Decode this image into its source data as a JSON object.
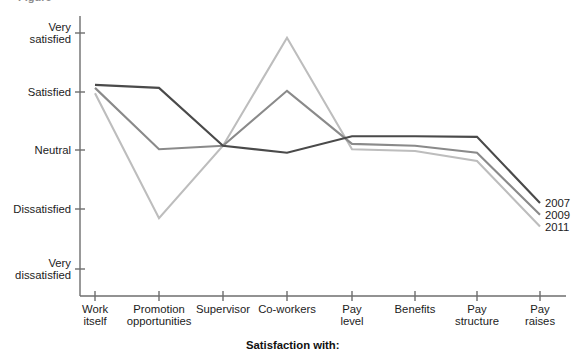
{
  "top_cropped_text": "Figure",
  "axis_title_x": "Satisfaction with:",
  "y_axis": {
    "labels": [
      {
        "line1": "Very",
        "line2": "satisfied",
        "value": 5
      },
      {
        "line1": "Satisfied",
        "line2": "",
        "value": 4
      },
      {
        "line1": "Neutral",
        "line2": "",
        "value": 3
      },
      {
        "line1": "Dissatisfied",
        "line2": "",
        "value": 2
      },
      {
        "line1": "Very",
        "line2": "dissatisfied",
        "value": 1
      }
    ]
  },
  "x_axis": {
    "labels": [
      {
        "line1": "Work",
        "line2": "itself"
      },
      {
        "line1": "Promotion",
        "line2": "opportunities"
      },
      {
        "line1": "Supervisor",
        "line2": ""
      },
      {
        "line1": "Co-workers",
        "line2": ""
      },
      {
        "line1": "Pay",
        "line2": "level"
      },
      {
        "line1": "Benefits",
        "line2": ""
      },
      {
        "line1": "Pay",
        "line2": "structure"
      },
      {
        "line1": "Pay",
        "line2": "raises"
      }
    ]
  },
  "legend": {
    "position": "right-end-of-lines",
    "entries": [
      {
        "label": "2007",
        "color": "#4a4a4a"
      },
      {
        "label": "2009",
        "color": "#8a8a8a"
      },
      {
        "label": "2011",
        "color": "#bdbdbd"
      }
    ]
  },
  "colors": {
    "axis": "#6e6e6e",
    "text": "#1c1c1c",
    "series_2007": "#4a4a4a",
    "series_2009": "#8a8a8a",
    "series_2011": "#bdbdbd"
  },
  "chart_data": {
    "type": "line",
    "title": "",
    "xlabel": "Satisfaction with:",
    "ylabel": "",
    "grid": false,
    "legend_position": "right",
    "ylim": [
      1,
      5
    ],
    "ytick_labels": [
      "Very dissatisfied",
      "Dissatisfied",
      "Neutral",
      "Satisfied",
      "Very satisfied"
    ],
    "ytick_values": [
      1,
      2,
      3,
      4,
      5
    ],
    "categories": [
      "Work itself",
      "Promotion opportunities",
      "Supervisor",
      "Co-workers",
      "Pay level",
      "Benefits",
      "Pay structure",
      "Pay raises"
    ],
    "series": [
      {
        "name": "2007",
        "color": "#4a4a4a",
        "values": [
          4.12,
          4.07,
          3.09,
          2.97,
          3.25,
          3.25,
          3.24,
          2.12
        ]
      },
      {
        "name": "2009",
        "color": "#8a8a8a",
        "values": [
          4.07,
          3.03,
          3.09,
          4.02,
          3.12,
          3.09,
          2.97,
          1.92
        ]
      },
      {
        "name": "2011",
        "color": "#bdbdbd",
        "values": [
          3.98,
          1.86,
          3.09,
          4.92,
          3.03,
          3.0,
          2.83,
          1.72
        ]
      }
    ]
  },
  "plot_geometry": {
    "x_ticks_px": [
      95,
      159,
      223,
      287,
      352,
      415,
      477,
      540
    ],
    "y_ticks_px": [
      33,
      92,
      150,
      209,
      269
    ],
    "axis_x_px": 80,
    "axis_baseline_y_px": 296
  }
}
